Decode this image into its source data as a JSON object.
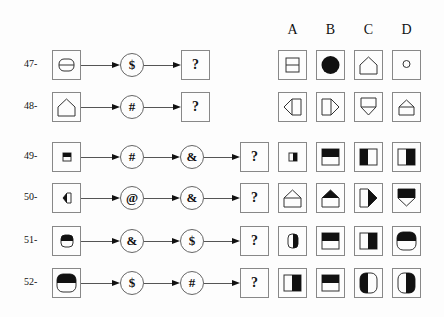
{
  "columns": [
    "A",
    "B",
    "C",
    "D"
  ],
  "rows": [
    {
      "label": "47-",
      "start": "box-rounded-outline-hline",
      "ops": [
        "$"
      ],
      "answer": "?",
      "options": [
        "square-split-h",
        "circle-filled",
        "house-outline",
        "circle-small"
      ]
    },
    {
      "label": "48-",
      "start": "house-outline",
      "ops": [
        "#"
      ],
      "answer": "?",
      "options": [
        "house-left",
        "house-right",
        "house-down",
        "house-up"
      ]
    },
    {
      "label": "49-",
      "start": "rect-top-filled-small",
      "ops": [
        "#",
        "&"
      ],
      "answer": "?",
      "options": [
        "rect-right-filled-small",
        "rect-top-filled-large",
        "rect-left-filled-large",
        "rect-right-filled-large"
      ]
    },
    {
      "label": "50-",
      "start": "house-left-filled-small",
      "ops": [
        "@",
        "&"
      ],
      "answer": "?",
      "options": [
        "house-up-outline",
        "house-up-filled",
        "house-right-filled",
        "house-down-filled"
      ]
    },
    {
      "label": "51-",
      "start": "cyl-top-filled-small",
      "ops": [
        "&",
        "$"
      ],
      "answer": "?",
      "options": [
        "cyl-right-filled-small",
        "rect-top-filled-large",
        "rect-right-filled-large",
        "cyl-top-filled-large"
      ]
    },
    {
      "label": "52-",
      "start": "cyl-top-filled-large",
      "ops": [
        "$",
        "#"
      ],
      "answer": "?",
      "options": [
        "rect-right-filled-large",
        "rect-top-filled-large",
        "cyl-left-filled-large",
        "cyl-right-filled-large"
      ]
    }
  ]
}
